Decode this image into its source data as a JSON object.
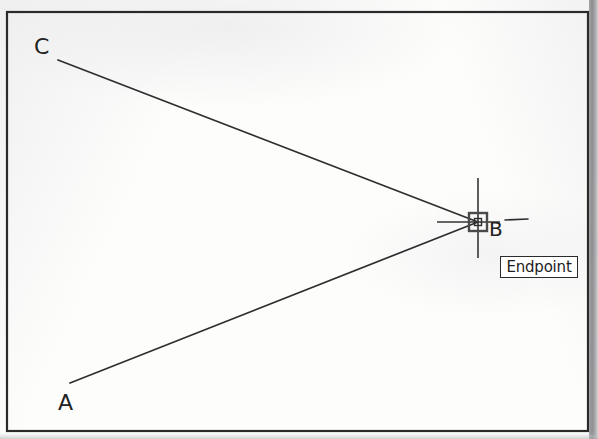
{
  "drawing": {
    "title": "Endpoint object snap",
    "frame": {
      "x": 7,
      "y": 12,
      "width": 581,
      "height": 419,
      "stroke_color": "#2a2a2a"
    },
    "background_color": "#fdfdfc",
    "line_color": "#2e2e2e"
  },
  "labels": {
    "a": "A",
    "b": "B",
    "c": "C"
  },
  "tooltip": {
    "text": "Endpoint",
    "x": 500,
    "y": 256,
    "width": 78,
    "height": 22,
    "border_color": "#2b2b2b",
    "background_color": "#ffffff",
    "text_color": "#1d1d1d"
  },
  "geometry": {
    "vertices": {
      "A": {
        "x": 70,
        "y": 383
      },
      "B": {
        "x": 478,
        "y": 222
      },
      "C": {
        "x": 58,
        "y": 60
      }
    },
    "segments": [
      {
        "name": "segment-ab",
        "from": "A",
        "to": "B"
      },
      {
        "name": "segment-cb",
        "from": "C",
        "to": "B"
      }
    ]
  },
  "snap_marker": {
    "type": "endpoint-square",
    "center_x": 478,
    "center_y": 222,
    "size": 18,
    "stroke_color": "#4a4a4a"
  },
  "crosshair": {
    "vertical": {
      "x": 478,
      "y1": 178,
      "y2": 258
    },
    "horizontal": {
      "y": 222,
      "x1": 437,
      "x2": 500
    },
    "stroke_color": "#353535"
  }
}
